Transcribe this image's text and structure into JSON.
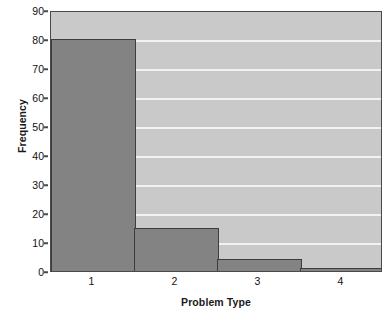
{
  "chart_data": {
    "type": "bar",
    "title": "",
    "subtitle": "",
    "xlabel": "Problem Type",
    "ylabel": "Frequency",
    "categories": [
      "1",
      "2",
      "3",
      "4"
    ],
    "values": [
      80,
      15,
      4,
      1
    ],
    "series": [
      {
        "name": "Frequency",
        "values": [
          80,
          15,
          4,
          1
        ]
      }
    ],
    "ylim": [
      0,
      90
    ],
    "yticks": [
      0,
      10,
      20,
      30,
      40,
      50,
      60,
      70,
      80,
      90
    ],
    "ytick_labels": [
      "0",
      "10",
      "20",
      "30",
      "40",
      "50",
      "60",
      "70",
      "80",
      "90"
    ],
    "xtick_labels": [
      "1",
      "2",
      "3",
      "4"
    ],
    "grid": true,
    "grid_axis": "y",
    "legend": false,
    "legend_position": "none",
    "bar_gap": 0,
    "style": "histogram-adjacent-bars",
    "colors": {
      "bar_fill": "#838383",
      "bar_edge": "#3d3d3d",
      "plot_background": "#c9c9c9",
      "gridline": "#f2f2f2",
      "axis_line": "#4a4a4a",
      "text": "#111111",
      "figure_background": "#ffffff"
    }
  }
}
